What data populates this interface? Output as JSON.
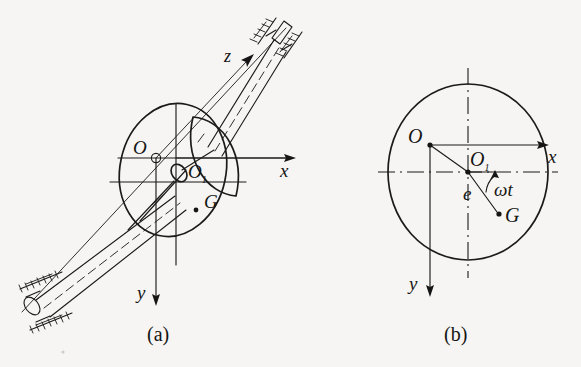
{
  "figure": {
    "background_color": "#f6f5f3",
    "ink_color": "#1b1b1b",
    "panels": [
      {
        "id": "a",
        "caption": "(a)",
        "description": "Three-dimensional view of an unbalanced disc mounted on a flexible shaft supported in two bearings",
        "labels": {
          "bearing_center": "O",
          "shaft_center": "O1",
          "mass_center": "G",
          "axis_x": "x",
          "axis_y": "y",
          "axis_z": "z"
        }
      },
      {
        "id": "b",
        "caption": "(b)",
        "description": "End view of the disc showing eccentricity e between shaft centre O1 and mass centre G at angle omega t",
        "labels": {
          "bearing_center": "O",
          "shaft_center": "O1",
          "mass_center": "G",
          "eccentricity": "e",
          "angle": "ωt",
          "axis_x": "x",
          "axis_y": "y"
        }
      }
    ]
  },
  "panel_a": {
    "caption": "(a)",
    "label_O": "O",
    "label_O1_main": "O",
    "label_O1_sub": "1",
    "label_G": "G",
    "label_x": "x",
    "label_y": "y",
    "label_z": "z"
  },
  "panel_b": {
    "caption": "(b)",
    "label_O": "O",
    "label_O1_main": "O",
    "label_O1_sub": "1",
    "label_G": "G",
    "label_e": "e",
    "label_omega_t": "ωt",
    "label_x": "x",
    "label_y": "y"
  }
}
